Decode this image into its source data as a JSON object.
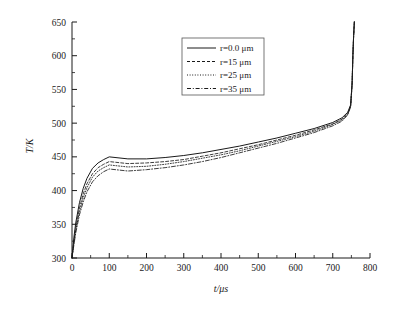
{
  "chart_data": {
    "type": "line",
    "title": "",
    "xlabel": "t/μs",
    "ylabel": "T/K",
    "xlim": [
      0,
      800
    ],
    "ylim": [
      300,
      650
    ],
    "xticks": [
      0,
      100,
      200,
      300,
      400,
      500,
      600,
      700,
      800
    ],
    "yticks": [
      300,
      350,
      400,
      450,
      500,
      550,
      600,
      650
    ],
    "xtick_labels": [
      "0",
      "100",
      "200",
      "300",
      "400",
      "500",
      "600",
      "700",
      "800"
    ],
    "ytick_labels": [
      "300",
      "350",
      "400",
      "450",
      "500",
      "550",
      "600",
      "650"
    ],
    "x_minor_step": 50,
    "y_minor_step": 25,
    "grid": false,
    "legend_position": "upper-center",
    "series": [
      {
        "name": "r=0.0 μm",
        "style": "solid",
        "x": [
          0,
          5,
          10,
          20,
          30,
          40,
          55,
          70,
          85,
          100,
          150,
          200,
          250,
          300,
          350,
          400,
          450,
          500,
          550,
          600,
          650,
          700,
          725,
          740,
          748,
          752,
          754,
          756,
          758
        ],
        "y": [
          300,
          330,
          352,
          382,
          403,
          418,
          433,
          441,
          446,
          450,
          447,
          447,
          449,
          452,
          456,
          461,
          466,
          472,
          478,
          485,
          492,
          501,
          508,
          516,
          527,
          560,
          600,
          630,
          650
        ]
      },
      {
        "name": "r=15 μm",
        "style": "dashed",
        "x": [
          0,
          5,
          10,
          20,
          30,
          40,
          55,
          70,
          85,
          100,
          150,
          200,
          250,
          300,
          350,
          400,
          450,
          500,
          550,
          600,
          650,
          700,
          725,
          740,
          748,
          752,
          754,
          756,
          758
        ],
        "y": [
          300,
          325,
          345,
          374,
          395,
          410,
          425,
          434,
          439,
          443,
          440,
          441,
          443,
          446,
          451,
          456,
          462,
          468,
          475,
          482,
          490,
          499,
          506,
          514,
          526,
          559,
          599,
          629,
          650
        ]
      },
      {
        "name": "r=25 μm",
        "style": "dotted",
        "x": [
          0,
          5,
          10,
          20,
          30,
          40,
          55,
          70,
          85,
          100,
          150,
          200,
          250,
          300,
          350,
          400,
          450,
          500,
          550,
          600,
          650,
          700,
          725,
          740,
          748,
          752,
          754,
          756,
          758
        ],
        "y": [
          300,
          322,
          341,
          369,
          389,
          404,
          420,
          429,
          434,
          438,
          435,
          436,
          439,
          443,
          448,
          453,
          459,
          466,
          473,
          480,
          488,
          498,
          505,
          513,
          525,
          558,
          598,
          629,
          650
        ]
      },
      {
        "name": "r=35 μm",
        "style": "dashdot",
        "x": [
          0,
          5,
          10,
          20,
          30,
          40,
          55,
          70,
          85,
          100,
          150,
          200,
          250,
          300,
          350,
          400,
          450,
          500,
          550,
          600,
          650,
          700,
          725,
          740,
          748,
          752,
          754,
          756,
          758
        ],
        "y": [
          300,
          319,
          337,
          364,
          383,
          398,
          413,
          422,
          428,
          432,
          429,
          431,
          434,
          438,
          443,
          449,
          456,
          463,
          470,
          478,
          486,
          496,
          503,
          512,
          524,
          557,
          598,
          628,
          650
        ]
      }
    ]
  },
  "legend": {
    "entries": [
      {
        "label": "r=0.0 μm"
      },
      {
        "label": "r=15 μm"
      },
      {
        "label": "r=25 μm"
      },
      {
        "label": "r=35 μm"
      }
    ]
  }
}
